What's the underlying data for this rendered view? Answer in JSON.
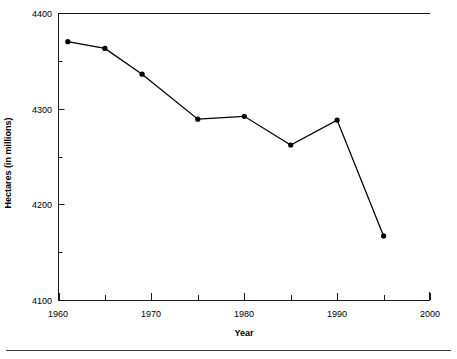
{
  "chart_data": {
    "type": "line",
    "title": "",
    "xlabel": "Year",
    "ylabel": "Hectares (in millions)",
    "xlim": [
      1960,
      2000
    ],
    "ylim": [
      4100,
      4400
    ],
    "xticks": [
      1960,
      1970,
      1980,
      1990,
      2000
    ],
    "xtick_labels": [
      "1960",
      "1970",
      "1980",
      "1990",
      "2000"
    ],
    "xminor_ticks": [
      1965,
      1975,
      1985,
      1995
    ],
    "yticks": [
      4100,
      4200,
      4300,
      4400
    ],
    "ytick_labels": [
      "4100",
      "4200",
      "4300",
      "4400"
    ],
    "yminor_ticks": [
      4150,
      4250,
      4350
    ],
    "grid": false,
    "legend": false,
    "series": [
      {
        "name": "Hectares",
        "color": "#000000",
        "marker": "filled-circle",
        "x": [
          1961,
          1965,
          1969,
          1975,
          1980,
          1985,
          1990,
          1995
        ],
        "values": [
          4370,
          4363,
          4336,
          4289,
          4292,
          4262,
          4288,
          4167
        ],
        "points": [
          {
            "x": 1961,
            "y": 4370
          },
          {
            "x": 1965,
            "y": 4363
          },
          {
            "x": 1969,
            "y": 4336
          },
          {
            "x": 1975,
            "y": 4289
          },
          {
            "x": 1980,
            "y": 4292
          },
          {
            "x": 1985,
            "y": 4262
          },
          {
            "x": 1990,
            "y": 4288
          },
          {
            "x": 1995,
            "y": 4167
          }
        ]
      }
    ]
  },
  "axis_titles": {
    "x": "Year",
    "y": "Hectares (in millions)"
  },
  "ytick_labels": {
    "t4400": "4400",
    "t4300": "4300",
    "t4200": "4200",
    "t4100": "4100"
  },
  "xtick_labels": {
    "t1960": "1960",
    "t1970": "1970",
    "t1980": "1980",
    "t1990": "1990",
    "t2000": "2000"
  },
  "colors": {
    "line": "#000000",
    "marker": "#000000",
    "axis": "#1a1a1a",
    "rule": "#3a3a3a",
    "background": "#ffffff"
  }
}
